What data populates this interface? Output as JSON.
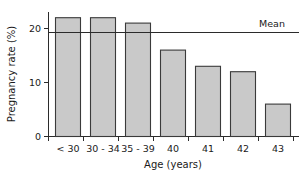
{
  "chart_data": {
    "type": "bar",
    "title": "",
    "subtitle": "",
    "xlabel": "Age (years)",
    "ylabel": "Pregnancy rate (%)",
    "categories": [
      "< 30",
      "30 - 34",
      "35 - 39",
      "40",
      "41",
      "42",
      "43"
    ],
    "values": [
      22,
      22,
      21,
      16,
      13,
      12,
      6
    ],
    "ylim": [
      0,
      23
    ],
    "yticks": [
      0,
      10,
      20
    ],
    "ytick_labels": [
      "0",
      "10",
      "20"
    ],
    "grid": false,
    "legend": "none",
    "annotations": [
      {
        "name": "mean-reference-line",
        "label": "Mean",
        "value": 19.3,
        "orientation": "horizontal"
      }
    ],
    "colors": {
      "bar_fill": "#c9c9c9",
      "bar_stroke": "#3a3a3a",
      "axis": "#2b2b2b",
      "text": "#1a1a1a",
      "background": "#ffffff"
    }
  }
}
